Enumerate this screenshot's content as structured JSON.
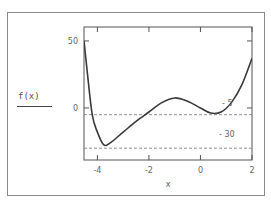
{
  "plot": {
    "y_label": "f(x)",
    "x_label": "x",
    "frame": {
      "left": 84,
      "top": 27,
      "right": 252,
      "bottom": 160
    },
    "x_range": [
      -4.52,
      2
    ],
    "y_range": [
      -38.8,
      60.4
    ],
    "x_ticks": [
      {
        "value": -4,
        "label": "-4"
      },
      {
        "value": -2,
        "label": "-2"
      },
      {
        "value": 0,
        "label": "0"
      },
      {
        "value": 2,
        "label": "2"
      }
    ],
    "y_ticks": [
      {
        "value": 50,
        "label": "50"
      },
      {
        "value": 0,
        "label": "0"
      }
    ],
    "markers": [
      {
        "value": -5,
        "label": "- 5"
      },
      {
        "value": -30,
        "label": "- 30"
      }
    ],
    "colors": {
      "curve": "#3a3a3a",
      "frame": "#555555",
      "dash": "#777777"
    }
  },
  "chart_data": {
    "type": "line",
    "title": "",
    "xlabel": "x",
    "ylabel": "f(x)",
    "xlim": [
      -4.52,
      2
    ],
    "ylim": [
      -38.8,
      60.4
    ],
    "x_ticks": [
      -4,
      -2,
      0,
      2
    ],
    "y_ticks": [
      50,
      0
    ],
    "grid": false,
    "horizontal_markers": [
      {
        "y": -5,
        "label": "-5",
        "style": "dashed"
      },
      {
        "y": -30,
        "label": "-30",
        "style": "dashed"
      }
    ],
    "series": [
      {
        "name": "f(x)",
        "x": [
          -4.52,
          -4.4,
          -4.2,
          -4.0,
          -3.75,
          -3.5,
          -3.0,
          -2.5,
          -2.0,
          -1.5,
          -1.0,
          -0.5,
          0.0,
          0.4,
          0.8,
          1.2,
          1.6,
          2.0
        ],
        "y": [
          50,
          28,
          -5,
          -18,
          -27.6,
          -26,
          -18,
          -10,
          -3,
          4,
          7.5,
          5,
          0,
          -3.8,
          -3,
          4,
          17,
          37
        ]
      }
    ]
  }
}
